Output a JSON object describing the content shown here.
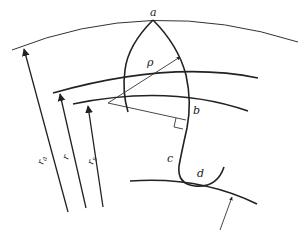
{
  "figure": {
    "points": {
      "a": "a",
      "b": "b",
      "c": "c",
      "d": "d"
    },
    "radii": {
      "rho": "ρ",
      "ra": "r",
      "ra_sub": "a",
      "r": "r",
      "rs": "r",
      "rs_sub": "s"
    },
    "colors": {
      "line": "#222222",
      "thin_line": "#333333",
      "background": "#ffffff"
    }
  }
}
